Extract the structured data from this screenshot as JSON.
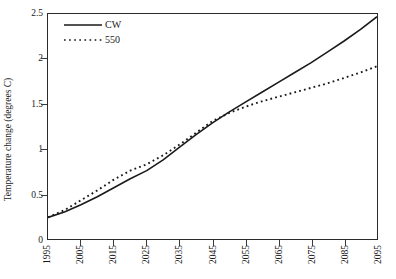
{
  "chart_data": {
    "type": "line",
    "title": "",
    "xlabel": "",
    "ylabel": "Temperature change (degrees C)",
    "xlim": [
      1995,
      2095
    ],
    "ylim": [
      0,
      2.5
    ],
    "grid": false,
    "legend_position": "top-left",
    "xticks": [
      "1995",
      "2005",
      "2015",
      "2025",
      "2035",
      "2045",
      "2055",
      "2065",
      "2075",
      "2085",
      "2095"
    ],
    "yticks": [
      "0",
      "0.5",
      "1",
      "1.5",
      "2",
      "2.5"
    ],
    "x": [
      1995,
      2000,
      2005,
      2010,
      2015,
      2020,
      2025,
      2030,
      2035,
      2040,
      2045,
      2050,
      2055,
      2060,
      2065,
      2070,
      2075,
      2080,
      2085,
      2090,
      2095
    ],
    "series": [
      {
        "name": "CW",
        "style": "solid",
        "color": "#1a1a1a",
        "values": [
          0.24,
          0.3,
          0.38,
          0.47,
          0.57,
          0.67,
          0.76,
          0.88,
          1.02,
          1.16,
          1.29,
          1.41,
          1.52,
          1.63,
          1.74,
          1.85,
          1.96,
          2.08,
          2.2,
          2.33,
          2.47
        ]
      },
      {
        "name": "550",
        "style": "dotted",
        "color": "#1a1a1a",
        "values": [
          0.24,
          0.32,
          0.43,
          0.54,
          0.66,
          0.76,
          0.83,
          0.93,
          1.05,
          1.18,
          1.31,
          1.4,
          1.47,
          1.53,
          1.58,
          1.63,
          1.68,
          1.73,
          1.79,
          1.85,
          1.92
        ]
      }
    ]
  },
  "legend": {
    "items": [
      {
        "label": "CW",
        "swatch": "solid-line-swatch"
      },
      {
        "label": "550",
        "swatch": "dotted-line-swatch"
      }
    ]
  }
}
